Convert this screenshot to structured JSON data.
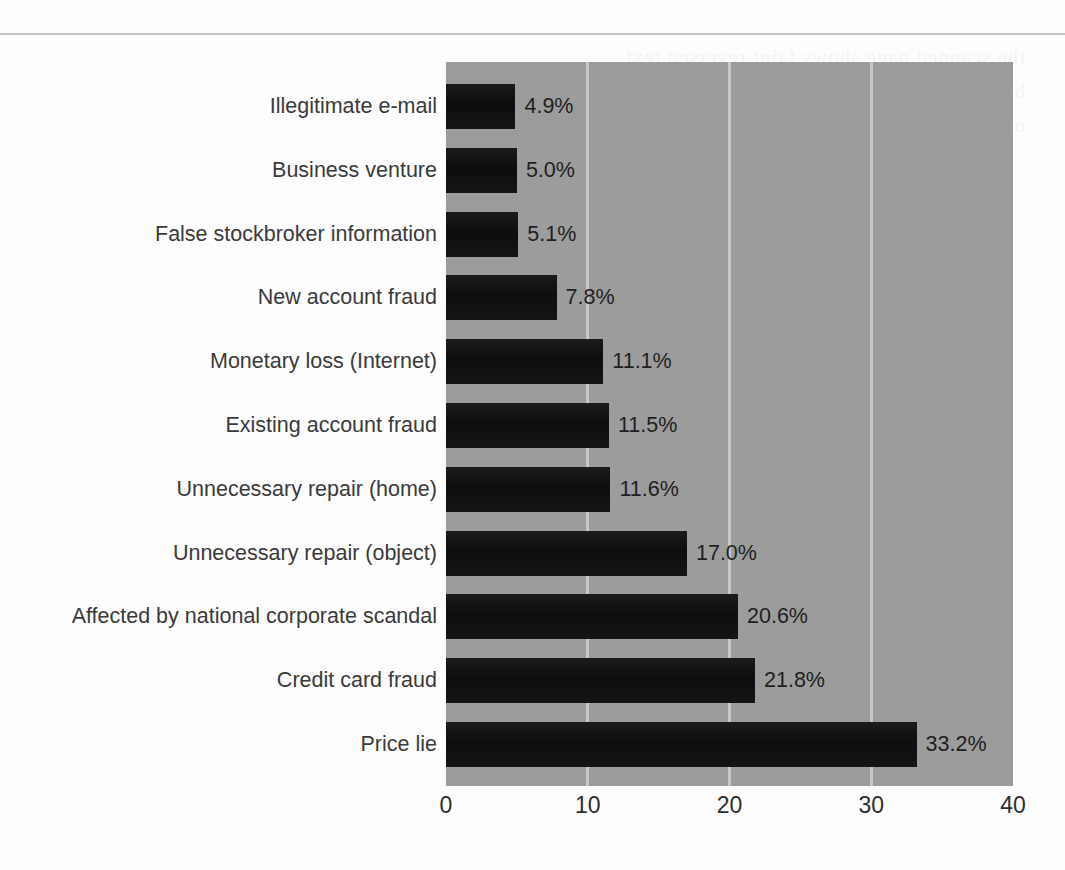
{
  "figure": {
    "background_color": "#9c9c9c",
    "bar_color": "#121212",
    "gridline_color": "#cfcfcf",
    "rule_color": "#b9b9b9"
  },
  "chart_data": {
    "type": "bar",
    "orientation": "horizontal",
    "title": "",
    "xlabel": "",
    "ylabel": "",
    "xlim": [
      0,
      40
    ],
    "xticks": [
      "0",
      "10",
      "20",
      "30",
      "40"
    ],
    "xtick_values": [
      0,
      10,
      20,
      30,
      40
    ],
    "grid": true,
    "legend": null,
    "categories": [
      "Illegitimate e-mail",
      "Business venture",
      "False stockbroker information",
      "New account fraud",
      "Monetary loss (Internet)",
      "Existing account fraud",
      "Unnecessary repair (home)",
      "Unnecessary repair (object)",
      "Affected by national corporate scandal",
      "Credit card fraud",
      "Price lie"
    ],
    "values": [
      4.9,
      5.0,
      5.1,
      7.8,
      11.1,
      11.5,
      11.6,
      17.0,
      20.6,
      21.8,
      33.2
    ],
    "value_labels": [
      "4.9%",
      "5.0%",
      "5.1%",
      "7.8%",
      "11.1%",
      "11.5%",
      "11.6%",
      "17.0%",
      "20.6%",
      "21.8%",
      "33.2%"
    ]
  },
  "bleed_lines": [
    "the scanned page shows faint reversed text",
    "bleeding through from the printed side",
    "of the original paper document"
  ]
}
